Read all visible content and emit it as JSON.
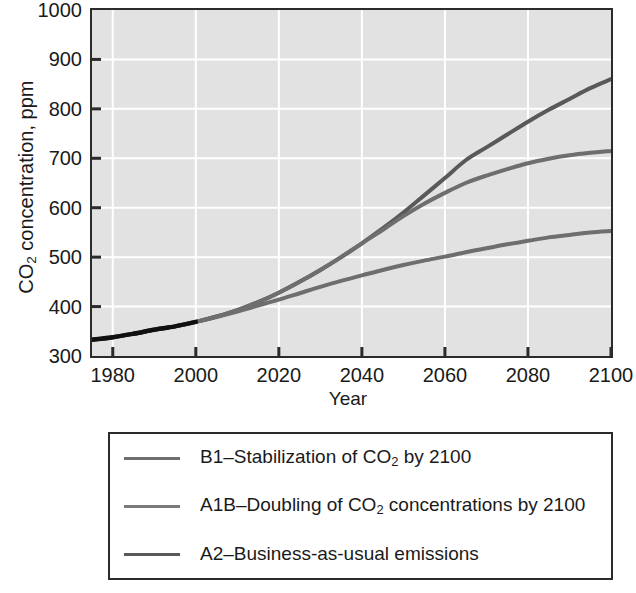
{
  "chart_data": {
    "type": "line",
    "title": "",
    "xlabel": "Year",
    "ylabel": "CO2 concentration, ppm",
    "ylabel_prefix": "CO",
    "ylabel_sub": "2",
    "ylabel_suffix": " concentration, ppm",
    "xlim": [
      1975,
      2100
    ],
    "ylim": [
      300,
      1000
    ],
    "xticks": [
      "1980",
      "2000",
      "2020",
      "2040",
      "2060",
      "2080",
      "2100"
    ],
    "xtick_values": [
      1980,
      2000,
      2020,
      2040,
      2060,
      2080,
      2100
    ],
    "yticks": [
      "300",
      "400",
      "500",
      "600",
      "700",
      "800",
      "900",
      "1000"
    ],
    "ytick_values": [
      300,
      400,
      500,
      600,
      700,
      800,
      900,
      1000
    ],
    "grid": true,
    "grid_color": "#ffffff",
    "plot_background": "#e2e2e2",
    "legend_position": "below-plot",
    "x": [
      1975,
      1980,
      1985,
      1990,
      1995,
      2000,
      2005,
      2010,
      2015,
      2020,
      2025,
      2030,
      2035,
      2040,
      2045,
      2050,
      2055,
      2060,
      2065,
      2070,
      2075,
      2080,
      2085,
      2090,
      2095,
      2100
    ],
    "series": [
      {
        "name": "A2-Business-as-usual emissions",
        "short": "A2",
        "color": "#595959",
        "values": [
          333,
          338,
          345,
          353,
          360,
          369,
          380,
          393,
          409,
          428,
          450,
          474,
          500,
          528,
          558,
          590,
          625,
          660,
          696,
          722,
          748,
          774,
          798,
          820,
          842,
          860
        ]
      },
      {
        "name": "A1B-Doubling of CO2 concentrations by 2100",
        "short": "A1B",
        "color": "#6e6e6e",
        "values": [
          333,
          338,
          345,
          353,
          360,
          369,
          380,
          393,
          409,
          428,
          450,
          474,
          500,
          528,
          555,
          583,
          608,
          630,
          650,
          665,
          678,
          690,
          699,
          706,
          711,
          715
        ]
      },
      {
        "name": "B1-Stabilization of CO2 by 2100",
        "short": "B1",
        "color": "#6e6e6e",
        "values": [
          333,
          338,
          345,
          353,
          360,
          369,
          379,
          390,
          402,
          414,
          427,
          440,
          452,
          463,
          474,
          484,
          493,
          501,
          510,
          518,
          526,
          533,
          540,
          545,
          550,
          553
        ]
      }
    ]
  },
  "legend": {
    "items": [
      {
        "prefix": "B1–Stabilization of CO",
        "sub": "2",
        "suffix": " by 2100",
        "color": "#6e6e6e"
      },
      {
        "prefix": "A1B–Doubling of CO",
        "sub": "2",
        "suffix": " concentrations by 2100",
        "color": "#7a7a7a"
      },
      {
        "prefix": "A2–Business-as-usual emissions",
        "sub": "",
        "suffix": "",
        "color": "#595959"
      }
    ]
  }
}
